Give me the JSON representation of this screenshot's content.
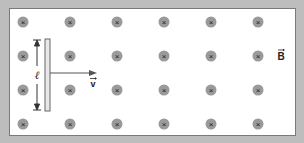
{
  "diagram": {
    "field_symbol": "×",
    "field_label": "B",
    "velocity_label": "v",
    "length_label": "ℓ",
    "grid": {
      "columns_x": [
        23,
        70,
        117,
        164,
        211,
        258
      ],
      "rows_y": [
        22,
        56,
        90,
        124
      ]
    },
    "colors": {
      "background": "#bdbdbd",
      "panel": "#ffffff",
      "field_dot": "#9a9a9a",
      "line": "#555555"
    }
  }
}
